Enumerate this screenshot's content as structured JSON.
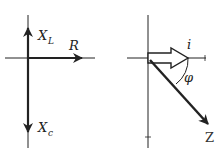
{
  "diagrams": [
    {
      "name": "impedance-components",
      "labels": {
        "xl_main": "X",
        "xl_sub": "L",
        "r": "R",
        "xc_main": "X",
        "xc_sub": "c"
      }
    },
    {
      "name": "phasor-current-impedance",
      "labels": {
        "i": "i",
        "phi": "φ",
        "z": "Z"
      }
    }
  ],
  "colors": {
    "line": "#222222",
    "background": "#ffffff"
  }
}
